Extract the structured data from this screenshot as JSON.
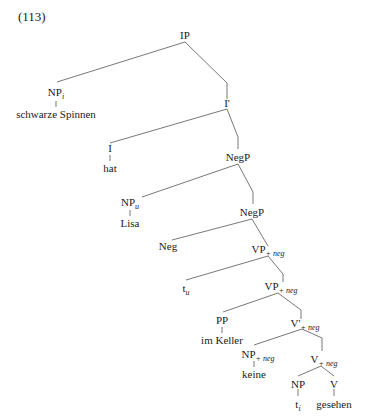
{
  "example_number": "(113)",
  "colors": {
    "line": "#555555",
    "text": "#1a1a1a",
    "background": "#ffffff"
  },
  "nodes": {
    "ip": {
      "label": "IP"
    },
    "np_i": {
      "label": "NP",
      "sub": "i",
      "word": "schwarze Spinnen"
    },
    "ibar": {
      "label": "I'"
    },
    "i": {
      "label": "I",
      "word": "hat"
    },
    "negp1": {
      "label": "NegP"
    },
    "np_u": {
      "label": "NP",
      "sub": "u",
      "word": "Lisa"
    },
    "negp2": {
      "label": "NegP"
    },
    "neg": {
      "label": "Neg"
    },
    "vp_neg1": {
      "label": "VP",
      "sub": "+ neg"
    },
    "t_u": {
      "label": "t",
      "sub": "u"
    },
    "vp_neg2": {
      "label": "VP",
      "sub": "+ neg"
    },
    "pp": {
      "label": "PP",
      "word": "im Keller"
    },
    "vbar_neg": {
      "label": "V'",
      "sub": "+ neg"
    },
    "np_neg": {
      "label": "NP",
      "sub": "+ neg",
      "word": "keine"
    },
    "v_neg": {
      "label": "V",
      "sub": "+ neg"
    },
    "np": {
      "label": "NP",
      "word_main": "t",
      "word_sub": "i"
    },
    "v": {
      "label": "V",
      "word": "gesehen"
    }
  }
}
